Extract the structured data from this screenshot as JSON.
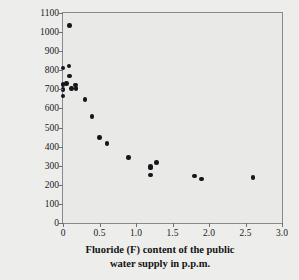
{
  "chart_data": {
    "type": "scatter",
    "title": "",
    "xlabel": "Fluoride (F) content of the public water supply in p.p.m.",
    "xlabel_line1": "Fluoride (F) content of the public",
    "xlabel_line2": "water supply in p.p.m.",
    "ylabel": "Dental caries experience (permanent teeth) per 1000 children examined",
    "ylabel_line1": "Dental caries experience",
    "ylabel_line2": "(permanent teeth) per 1000 children examined",
    "xlim": [
      0,
      3.0
    ],
    "ylim": [
      0,
      1100
    ],
    "xticks": [
      0,
      0.5,
      1.0,
      1.5,
      2.0,
      2.5,
      3.0
    ],
    "xtick_labels": [
      "0",
      "0.5",
      "1.0",
      "1.5",
      "2.0",
      "2.5",
      "3.0"
    ],
    "yticks": [
      0,
      100,
      200,
      300,
      400,
      500,
      600,
      700,
      800,
      900,
      1000,
      1100
    ],
    "ytick_labels": [
      "0",
      "100",
      "200",
      "300",
      "400",
      "500",
      "600",
      "700",
      "800",
      "900",
      "1000",
      "1100"
    ],
    "grid": false,
    "legend": null,
    "marker_color": "#16161a",
    "plot_background": "#e9e9e7",
    "figure_background": "#ededeb",
    "axis_color": "#8a8a8a",
    "points": [
      {
        "x": 0.0,
        "y": 812
      },
      {
        "x": 0.0,
        "y": 725
      },
      {
        "x": 0.0,
        "y": 700
      },
      {
        "x": 0.0,
        "y": 665
      },
      {
        "x": 0.05,
        "y": 730
      },
      {
        "x": 0.08,
        "y": 822
      },
      {
        "x": 0.09,
        "y": 1035
      },
      {
        "x": 0.09,
        "y": 770
      },
      {
        "x": 0.12,
        "y": 703
      },
      {
        "x": 0.17,
        "y": 722
      },
      {
        "x": 0.18,
        "y": 703
      },
      {
        "x": 0.3,
        "y": 648
      },
      {
        "x": 0.4,
        "y": 557
      },
      {
        "x": 0.5,
        "y": 447
      },
      {
        "x": 0.6,
        "y": 416
      },
      {
        "x": 0.9,
        "y": 344
      },
      {
        "x": 1.2,
        "y": 297
      },
      {
        "x": 1.2,
        "y": 288
      },
      {
        "x": 1.2,
        "y": 252
      },
      {
        "x": 1.28,
        "y": 318
      },
      {
        "x": 1.8,
        "y": 246
      },
      {
        "x": 1.9,
        "y": 231
      },
      {
        "x": 2.6,
        "y": 239
      }
    ]
  }
}
